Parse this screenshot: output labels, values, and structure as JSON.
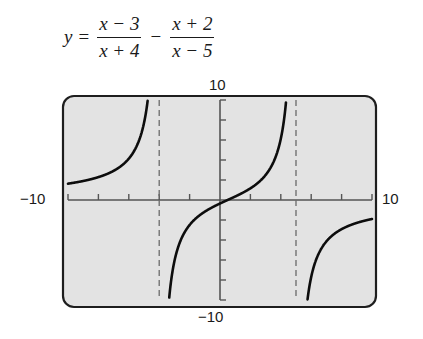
{
  "equation": {
    "lhs": "y",
    "equals": "=",
    "term1": {
      "numerator": "x − 3",
      "denominator": "x + 4"
    },
    "operator": "−",
    "term2": {
      "numerator": "x + 2",
      "denominator": "x − 5"
    }
  },
  "window": {
    "xmin_label": "−10",
    "xmax_label": "10",
    "ymax_label": "10",
    "ymin_label": "−10"
  },
  "colors": {
    "screen_bg": "#e3e3e3",
    "frame": "#1e1e1e",
    "axes": "#555555",
    "curve": "#0d0d0d",
    "asymptote": "#6a6a6a"
  },
  "chart_data": {
    "type": "line",
    "function": "(x-3)/(x+4) - (x+2)/(x-5)",
    "xlabel": "",
    "ylabel": "",
    "xlim": [
      -10,
      10
    ],
    "ylim": [
      -10,
      10
    ],
    "x_tick_step": 2,
    "y_tick_step": 2,
    "grid": false,
    "vertical_asymptotes": [
      -4,
      5
    ],
    "horizontal_asymptote": 0,
    "tick_labels": {
      "x": [
        "−10",
        "10"
      ],
      "y": [
        "−10",
        "10"
      ]
    },
    "series": [
      {
        "name": "branch x < −4",
        "x": [
          -10,
          -8,
          -6,
          -5,
          -4.6,
          -4.4
        ],
        "y": [
          -1.5,
          -2.38,
          -3.55,
          -5.3,
          -9.45,
          -9.74
        ]
      },
      {
        "name": "branch −4 < x < 5",
        "x": [
          -3.5,
          -3,
          -2,
          0,
          2,
          3,
          4,
          4.5
        ],
        "y": [
          -12.1,
          -6.25,
          -2.5,
          -0.35,
          2.94,
          4.5,
          6.13,
          13.53
        ]
      },
      {
        "name": "branch x > 5",
        "x": [
          5.6,
          6,
          7,
          8,
          10
        ],
        "y": [
          -12.3,
          -7.7,
          -4.07,
          -2.88,
          -1.71
        ]
      }
    ]
  }
}
